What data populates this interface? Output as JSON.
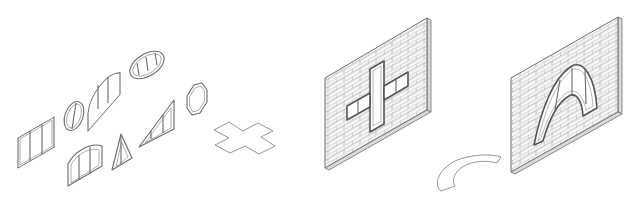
{
  "figure": {
    "colors": {
      "background": "#ffffff",
      "line": "#6a6a6a",
      "light_line": "#9a9a9a",
      "wall_fill": "#f4f4f4",
      "wall_edge": "#d9d9d9"
    },
    "window_library": {
      "label": "",
      "shapes": [
        {
          "name": "rectangular-window",
          "mullions": 2
        },
        {
          "name": "circular-window",
          "mullions": 1
        },
        {
          "name": "half-round-window",
          "mullions": 2
        },
        {
          "name": "elliptical-window",
          "mullions": 3
        },
        {
          "name": "octagonal-window",
          "mullions": 0
        },
        {
          "name": "segmental-arch-window",
          "mullions": 2
        },
        {
          "name": "triangle-window",
          "mullions": 1
        },
        {
          "name": "right-triangle-window",
          "mullions": 2
        }
      ]
    },
    "cut_profiles": [
      {
        "name": "cross-profile"
      },
      {
        "name": "arc-profile"
      }
    ],
    "walls": [
      {
        "name": "brick-wall-with-cross-opening",
        "opening": "cross"
      },
      {
        "name": "brick-wall-with-arch-opening",
        "opening": "arch"
      }
    ]
  }
}
